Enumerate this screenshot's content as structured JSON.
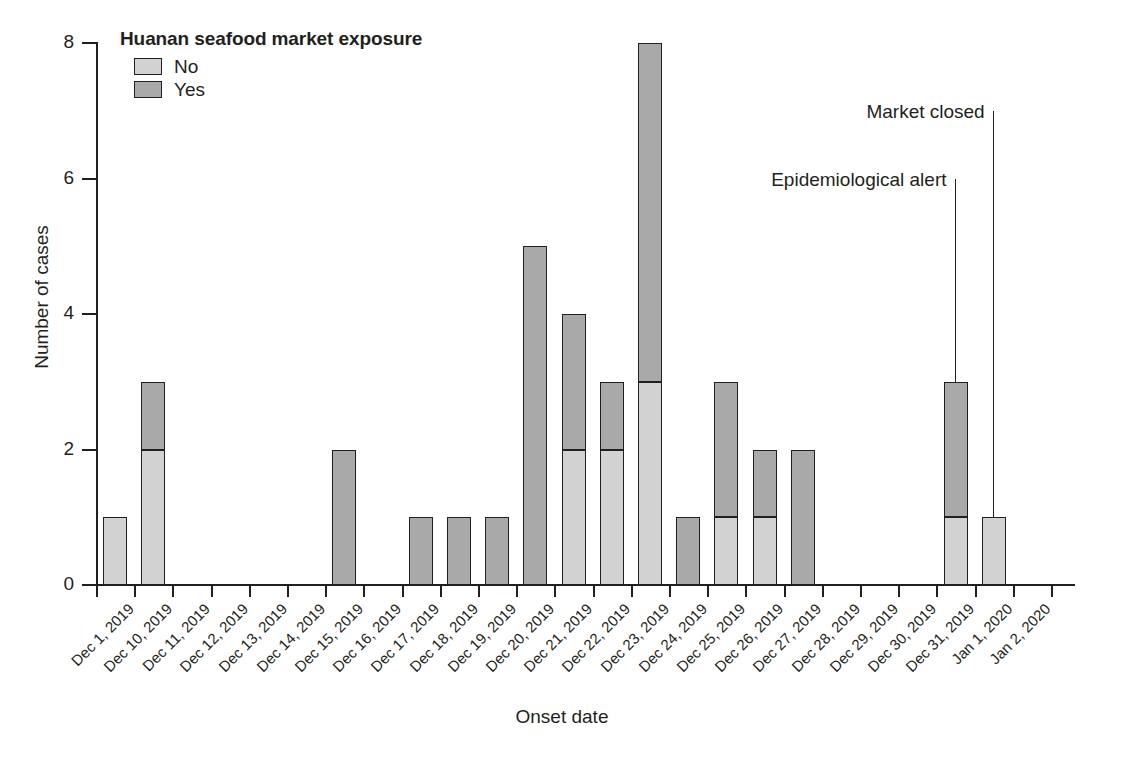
{
  "chart_data": {
    "type": "bar",
    "subtype": "stacked-bar-epidemic-curve",
    "title": "",
    "xlabel": "Onset date",
    "ylabel": "Number of cases",
    "ylim": [
      0,
      8
    ],
    "yticks": [
      0,
      2,
      4,
      6,
      8
    ],
    "grid": false,
    "legend": {
      "title": "Huanan seafood market exposure",
      "position": "top-left-inside",
      "entries": [
        {
          "name": "No",
          "color": "#d2d2d2"
        },
        {
          "name": "Yes",
          "color": "#a9a9a9"
        }
      ]
    },
    "categories": [
      "Dec 1, 2019",
      "Dec 10, 2019",
      "Dec 11, 2019",
      "Dec 12, 2019",
      "Dec 13, 2019",
      "Dec 14, 2019",
      "Dec 15, 2019",
      "Dec 16, 2019",
      "Dec 17, 2019",
      "Dec 18, 2019",
      "Dec 19, 2019",
      "Dec 20, 2019",
      "Dec 21, 2019",
      "Dec 22, 2019",
      "Dec 23, 2019",
      "Dec 24, 2019",
      "Dec 25, 2019",
      "Dec 26, 2019",
      "Dec 27, 2019",
      "Dec 28, 2019",
      "Dec 29, 2019",
      "Dec 30, 2019",
      "Dec 31, 2019",
      "Jan 1, 2020",
      "Jan 2, 2020"
    ],
    "series": [
      {
        "name": "No",
        "color": "#d2d2d2",
        "values": [
          1,
          2,
          0,
          0,
          0,
          0,
          0,
          0,
          0,
          0,
          0,
          0,
          2,
          2,
          3,
          0,
          1,
          1,
          0,
          0,
          0,
          0,
          1,
          1,
          0
        ]
      },
      {
        "name": "Yes",
        "color": "#a9a9a9",
        "values": [
          0,
          1,
          0,
          0,
          0,
          0,
          2,
          0,
          1,
          1,
          1,
          5,
          2,
          1,
          5,
          1,
          2,
          1,
          2,
          0,
          0,
          0,
          2,
          0,
          0
        ]
      }
    ],
    "totals": [
      1,
      3,
      0,
      0,
      0,
      0,
      2,
      0,
      1,
      1,
      1,
      5,
      4,
      3,
      8,
      1,
      3,
      2,
      2,
      0,
      0,
      0,
      3,
      1,
      0
    ],
    "annotations": [
      {
        "label": "Epidemiological alert",
        "category": "Dec 31, 2019",
        "line_top_value": 6.0
      },
      {
        "label": "Market closed",
        "category": "Jan 1, 2020",
        "line_top_value": 7.0
      }
    ]
  }
}
